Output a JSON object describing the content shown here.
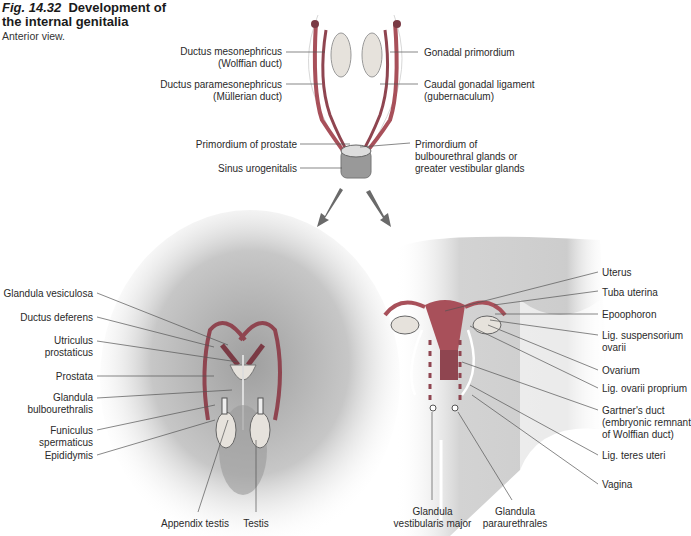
{
  "figure": {
    "number": "Fig. 14.32",
    "title_line1": "Development of",
    "title_line2": "the internal genitalia",
    "subtitle": "Anterior view."
  },
  "top_labels": {
    "left": [
      {
        "l1": "Ductus mesonephricus",
        "l2": "(Wolffian duct)"
      },
      {
        "l1": "Ductus paramesonephricus",
        "l2": "(Müllerian duct)"
      },
      {
        "l1": "Primordium of prostate"
      },
      {
        "l1": "Sinus urogenitalis"
      }
    ],
    "right": [
      {
        "l1": "Gonadal primordium"
      },
      {
        "l1": "Caudal gonadal ligament",
        "l2": "(gubernaculum)"
      },
      {
        "l1": "Primordium of",
        "l2": "bulbourethral glands or",
        "l3": "greater vestibular glands"
      }
    ]
  },
  "male_labels": [
    {
      "l1": "Glandula vesiculosa"
    },
    {
      "l1": "Ductus deferens"
    },
    {
      "l1": "Utriculus",
      "l2": "prostaticus"
    },
    {
      "l1": "Prostata"
    },
    {
      "l1": "Glandula",
      "l2": "bulbourethralis"
    },
    {
      "l1": "Funiculus",
      "l2": "spermaticus"
    },
    {
      "l1": "Epididymis"
    }
  ],
  "male_bottom_labels": [
    {
      "l1": "Appendix testis"
    },
    {
      "l1": "Testis"
    }
  ],
  "female_labels": [
    {
      "l1": "Uterus"
    },
    {
      "l1": "Tuba uterina"
    },
    {
      "l1": "Epoophoron"
    },
    {
      "l1": "Lig. suspensorium",
      "l2": "ovarii"
    },
    {
      "l1": "Ovarium"
    },
    {
      "l1": "Lig. ovarii proprium"
    },
    {
      "l1": "Gartner's duct",
      "l2": "(embryonic remnant",
      "l3": "of Wolffian duct)"
    },
    {
      "l1": "Lig. teres uteri"
    },
    {
      "l1": "Vagina"
    }
  ],
  "female_bottom_labels": [
    {
      "l1": "Glandula",
      "l2": "vestibularis major"
    },
    {
      "l1": "Glandula",
      "l2": "paraurethrales"
    }
  ],
  "colors": {
    "duct_red": "#a8505a",
    "gonad_fill": "#e6e2dc",
    "body_shadow": "#a0a0a0",
    "leader": "#555555"
  }
}
